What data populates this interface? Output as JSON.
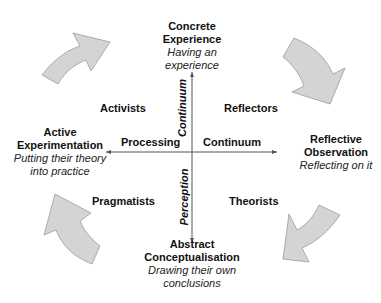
{
  "diagram": {
    "poles": {
      "top": {
        "title_line1": "Concrete",
        "title_line2": "Experience",
        "sub_line1": "Having an",
        "sub_line2": "experience"
      },
      "right": {
        "title_line1": "Reflective",
        "title_line2": "Observation",
        "sub_line1": "Reflecting on it"
      },
      "bottom": {
        "title_line1": "Abstract",
        "title_line2": "Conceptualisation",
        "sub_line1": "Drawing their own",
        "sub_line2": "conclusions"
      },
      "left": {
        "title_line1": "Active",
        "title_line2": "Experimentation",
        "sub_line1": "Putting their theory",
        "sub_line2": "into practice"
      }
    },
    "quadrants": {
      "top_left": "Activists",
      "top_right": "Reflectors",
      "bottom_right": "Theorists",
      "bottom_left": "Pragmatists"
    },
    "axes": {
      "horizontal_left_label": "Processing",
      "horizontal_right_label": "Continuum",
      "vertical_top_label": "Continuum",
      "vertical_bottom_label": "Perception"
    },
    "colors": {
      "arrow_fill": "#d4d4d4",
      "arrow_stroke": "#9a9a9a",
      "axis_line": "#555555"
    },
    "cycle_arrows": [
      "top-left-arrow",
      "top-right-arrow",
      "bottom-right-arrow",
      "bottom-left-arrow"
    ]
  }
}
